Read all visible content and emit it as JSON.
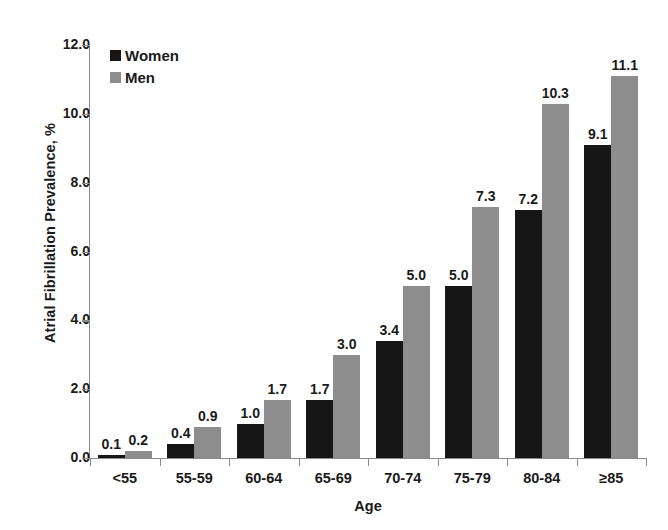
{
  "chart_data": {
    "type": "bar",
    "title": "",
    "xlabel": "Age",
    "ylabel": "Atrial Fibrillation Prevalence, %",
    "categories": [
      "<55",
      "55-59",
      "60-64",
      "65-69",
      "70-74",
      "75-79",
      "80-84",
      "≥85"
    ],
    "series": [
      {
        "name": "Women",
        "color": "#161616",
        "values": [
          0.1,
          0.4,
          1.0,
          1.7,
          3.4,
          5.0,
          7.2,
          9.1
        ],
        "labels": [
          "0.1",
          "0.4",
          "1.0",
          "1.7",
          "3.4",
          "5.0",
          "7.2",
          "9.1"
        ]
      },
      {
        "name": "Men",
        "color": "#8d8d8d",
        "values": [
          0.2,
          0.9,
          1.7,
          3.0,
          5.0,
          7.3,
          10.3,
          11.1
        ],
        "labels": [
          "0.2",
          "0.9",
          "1.7",
          "3.0",
          "5.0",
          "7.3",
          "10.3",
          "11.1"
        ]
      }
    ],
    "ylim": [
      0,
      12
    ],
    "ytick_values": [
      0,
      2,
      4,
      6,
      8,
      10,
      12
    ],
    "ytick_labels": [
      "0.0",
      "2.0",
      "4.0",
      "6.0",
      "8.0",
      "10.0",
      "12.0"
    ],
    "grid": false,
    "legend_position": "top-left",
    "axis_color": "#8a8a8a"
  }
}
